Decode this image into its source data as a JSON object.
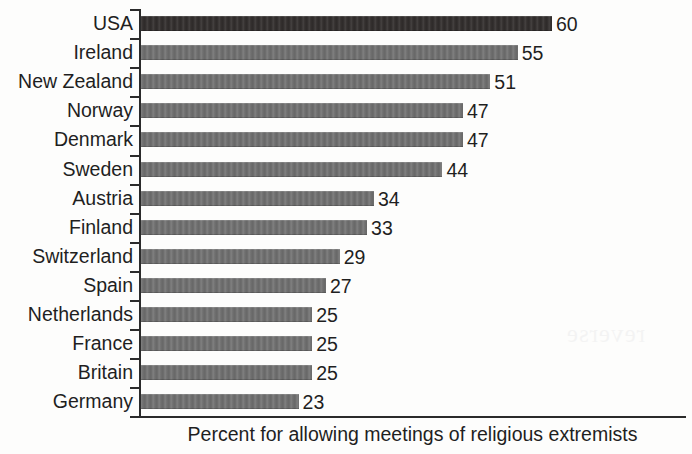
{
  "chart_data": {
    "type": "bar",
    "orientation": "horizontal",
    "title": "",
    "xlabel": "Percent for allowing meetings of religious extremists",
    "ylabel": "",
    "categories": [
      "USA",
      "Ireland",
      "New Zealand",
      "Norway",
      "Denmark",
      "Sweden",
      "Austria",
      "Finland",
      "Switzerland",
      "Spain",
      "Netherlands",
      "France",
      "Britain",
      "Germany"
    ],
    "values": [
      60,
      55,
      51,
      47,
      47,
      44,
      34,
      33,
      29,
      27,
      25,
      25,
      25,
      23
    ],
    "value_labels": [
      "60",
      "55",
      "51",
      "47",
      "47",
      "44",
      "34",
      "33",
      "29",
      "27",
      "25",
      "25",
      "25",
      "23"
    ],
    "xlim": [
      0,
      60
    ],
    "grid": false,
    "legend": null,
    "highlight_index": 0,
    "colors": {
      "bar": "#6f6f6f",
      "bar_highlight": "#332f2e",
      "axis": "#2b2b2b",
      "text": "#1f1f1f",
      "background": "#fdfdfc"
    }
  },
  "caption": {
    "text": "Percent for allowing meetings of religious extremists"
  }
}
